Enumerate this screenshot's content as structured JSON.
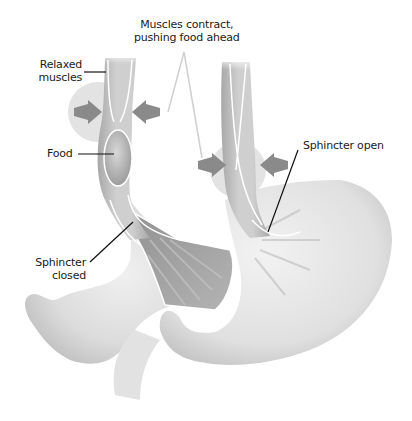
{
  "diagram": {
    "colors": {
      "background": "#ffffff",
      "tissue_light": "#e4e4e4",
      "tissue_mid": "#c8c8c8",
      "tissue_dark": "#9a9a9a",
      "arrow": "#8a8a8a",
      "halo": "#d6d6d6",
      "leader_line": "#111111",
      "pointer_line": "#cfcfcf",
      "highlight": "#ffffff"
    },
    "labels": {
      "muscles_contract_line1": "Muscles contract,",
      "muscles_contract_line2": "pushing food ahead",
      "relaxed_line1": "Relaxed",
      "relaxed_line2": "muscles",
      "food": "Food",
      "sphincter_closed_line1": "Sphincter",
      "sphincter_closed_line2": "closed",
      "sphincter_open": "Sphincter open"
    },
    "panels": [
      {
        "name": "left",
        "state": "Sphincter closed",
        "contains_food_bolus": true
      },
      {
        "name": "right",
        "state": "Sphincter open",
        "contains_food_bolus": false
      }
    ],
    "icons": [
      "contraction-arrow-icon",
      "contraction-arrow-icon",
      "contraction-arrow-icon",
      "contraction-arrow-icon"
    ]
  }
}
